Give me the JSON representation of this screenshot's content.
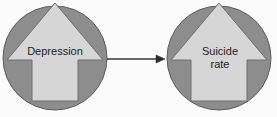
{
  "diagram": {
    "type": "causal-relationship-diagram",
    "background_color": "#fbfbfb",
    "circle_fill": "#8d8d8d",
    "circle_stroke": "#5d5d5d",
    "arrow_shape_fill": "#d6d6d6",
    "arrow_shape_stroke": "#707070",
    "connector_color": "#3a3a3a",
    "text_color": "#1d1d1d",
    "nodes": [
      {
        "id": "cause",
        "label": "Depression",
        "shape": "circle-with-up-arrow",
        "center_x": 55,
        "center_y": 58,
        "radius": 52
      },
      {
        "id": "effect",
        "label": "Suicide\nrate",
        "shape": "circle-with-up-arrow",
        "center_x": 219,
        "center_y": 58,
        "radius": 52
      }
    ],
    "connector": {
      "id": "cause-to-effect",
      "from": "cause",
      "to": "effect",
      "direction": "left-to-right",
      "style": "solid-line-with-arrowhead",
      "start_x": 107,
      "end_x": 165,
      "y": 59
    }
  }
}
